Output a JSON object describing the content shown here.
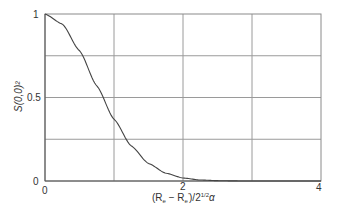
{
  "chart_data": {
    "type": "line",
    "title": "",
    "xlabel": "(R_e − R_e')/2^{1/2}α",
    "ylabel": "S(0,0)²",
    "xlim": [
      0,
      4
    ],
    "ylim": [
      0,
      1
    ],
    "grid": true,
    "legend": null,
    "x_ticks": [
      0,
      2,
      4
    ],
    "x_tick_labels": [
      "0",
      "2",
      "4"
    ],
    "y_ticks": [
      0,
      0.5,
      1
    ],
    "y_tick_labels": [
      "0",
      "0.5",
      "1"
    ],
    "x_gridlines": [
      0,
      1,
      2,
      3,
      4
    ],
    "y_gridlines": [
      0,
      0.25,
      0.5,
      0.75,
      1
    ],
    "series": [
      {
        "name": "S(0,0)^2",
        "color": "#444444",
        "x": [
          0,
          0.25,
          0.5,
          0.75,
          1.0,
          1.25,
          1.5,
          1.75,
          2.0,
          2.25,
          2.5,
          2.75,
          3.0,
          3.5,
          4.0
        ],
        "y": [
          1.0,
          0.94,
          0.78,
          0.57,
          0.37,
          0.21,
          0.105,
          0.047,
          0.018,
          0.006,
          0.002,
          0.0005,
          0.0001,
          0.0,
          0.0
        ]
      }
    ]
  },
  "labels": {
    "y_axis": "S(0,0)²",
    "x_axis_main": "(R",
    "x_axis_sub1": "e",
    "x_axis_mid": " − R",
    "x_axis_sub2": "e",
    "x_axis_sup2": "'",
    "x_axis_end": ")/2",
    "x_axis_exp": "1/2",
    "x_axis_alpha": "α",
    "x_tick_0": "0",
    "x_tick_2": "2",
    "x_tick_4": "4",
    "y_tick_0": "0",
    "y_tick_05": "0.5",
    "y_tick_1": "1"
  }
}
